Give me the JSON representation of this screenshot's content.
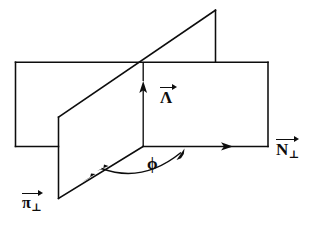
{
  "figure": {
    "kind": "vector-plane-diagram",
    "background_color": "#ffffff",
    "line_color": "#0d0d0d"
  },
  "labels": {
    "lambda": {
      "symbol": "Λ",
      "subscript": "",
      "has_vector_arrow": true,
      "name": "Lambda vector"
    },
    "n_perp": {
      "symbol": "N",
      "subscript": "⊥",
      "has_vector_arrow": true,
      "name": "N perpendicular vector"
    },
    "pi_perp": {
      "symbol": "π",
      "subscript": "⊥",
      "has_vector_arrow": true,
      "name": "pi perpendicular vector"
    },
    "phi": {
      "symbol": "ϕ",
      "name": "azimuthal angle phi"
    }
  },
  "geometry": {
    "horizontal_plane": {
      "name": "N-perp plane",
      "points": "15,62 268,62 268,146 15,146"
    },
    "slanted_plane": {
      "name": "pi-perp plane",
      "points": "215,10 58,117 58,198 215,91"
    },
    "lambda_axis": {
      "x": 143,
      "y_top": 84,
      "y_bottom": 146
    },
    "n_perp_axis": {
      "y": 146,
      "x_start": 143,
      "x_end": 268
    },
    "pi_perp_axis": {
      "x_start": 143,
      "y_start": 146,
      "x_end": 58,
      "y_end": 198
    },
    "phi_arc": {
      "center_x": 143,
      "center_y": 146,
      "radius": 48,
      "double_headed": true
    }
  }
}
